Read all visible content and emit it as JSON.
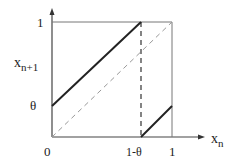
{
  "diagram": {
    "type": "piecewise-map-plot",
    "y_axis_label": "x",
    "y_axis_subscript": "n+1",
    "x_axis_label": "x",
    "x_axis_subscript": "n",
    "ticks": {
      "y_one": "1",
      "y_theta": "θ",
      "origin": "0",
      "x_one_minus_theta": "1-θ",
      "x_one": "1"
    },
    "elements": {
      "upper_segment": "solid line from (0, θ) to (1-θ, 1)",
      "lower_segment": "solid line from (1-θ, 0) to (1, θ)",
      "diagonal": "dashed line from (0,0) to (1,1)",
      "vertical_guide": "dashed line at x = 1-θ"
    },
    "colors": {
      "lines": "#222222",
      "frame": "#555555",
      "dashed": "#888888"
    }
  }
}
